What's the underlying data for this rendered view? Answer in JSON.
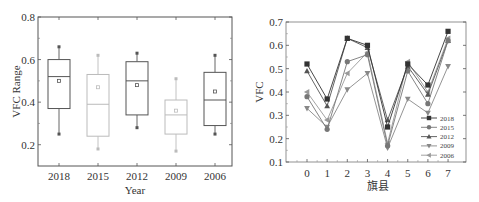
{
  "chart_data": [
    {
      "type": "box",
      "title": "",
      "xlabel": "Year",
      "ylabel": "VFC Range",
      "ylim": [
        0.1,
        0.8
      ],
      "yticks": [
        "0.2",
        "0.4",
        "0.6",
        "0.8"
      ],
      "categories": [
        "2018",
        "2015",
        "2012",
        "2009",
        "2006"
      ],
      "boxes": [
        {
          "name": "2018",
          "whisker_low": 0.25,
          "q1": 0.37,
          "median": 0.52,
          "q3": 0.6,
          "whisker_high": 0.66,
          "mean": 0.5,
          "color": "#555555"
        },
        {
          "name": "2015",
          "whisker_low": 0.18,
          "q1": 0.24,
          "median": 0.39,
          "q3": 0.53,
          "whisker_high": 0.62,
          "mean": 0.47,
          "color": "#bbbbbb"
        },
        {
          "name": "2012",
          "whisker_low": 0.28,
          "q1": 0.34,
          "median": 0.5,
          "q3": 0.59,
          "whisker_high": 0.63,
          "mean": 0.48,
          "color": "#555555"
        },
        {
          "name": "2009",
          "whisker_low": 0.17,
          "q1": 0.25,
          "median": 0.34,
          "q3": 0.41,
          "whisker_high": 0.51,
          "mean": 0.36,
          "color": "#bbbbbb"
        },
        {
          "name": "2006",
          "whisker_low": 0.25,
          "q1": 0.29,
          "median": 0.41,
          "q3": 0.54,
          "whisker_high": 0.62,
          "mean": 0.45,
          "color": "#555555"
        }
      ],
      "grid": false
    },
    {
      "type": "line",
      "title": "",
      "xlabel": "旗县",
      "ylabel": "VFC",
      "ylim": [
        0.1,
        0.7
      ],
      "yticks": [
        "0.1",
        "0.2",
        "0.3",
        "0.4",
        "0.5",
        "0.6",
        "0.7"
      ],
      "x": [
        0,
        1,
        2,
        3,
        4,
        5,
        6,
        7
      ],
      "xticks": [
        "0",
        "1",
        "2",
        "3",
        "4",
        "5",
        "6",
        "7"
      ],
      "legend_position": "lower right",
      "grid": false,
      "series": [
        {
          "name": "2018",
          "marker": "square",
          "color": "#333333",
          "values": [
            0.52,
            0.37,
            0.63,
            0.6,
            0.25,
            0.52,
            0.43,
            0.66
          ]
        },
        {
          "name": "2015",
          "marker": "circle",
          "color": "#777777",
          "values": [
            0.38,
            0.24,
            0.53,
            0.56,
            0.17,
            0.49,
            0.35,
            0.62
          ]
        },
        {
          "name": "2012",
          "marker": "triangle-up",
          "color": "#555555",
          "values": [
            0.49,
            0.34,
            0.63,
            0.59,
            0.28,
            0.51,
            0.39,
            0.62
          ]
        },
        {
          "name": "2009",
          "marker": "triangle-down",
          "color": "#888888",
          "values": [
            0.33,
            0.25,
            0.41,
            0.48,
            0.16,
            0.37,
            0.31,
            0.51
          ]
        },
        {
          "name": "2006",
          "marker": "triangle-left",
          "color": "#999999",
          "values": [
            0.4,
            0.28,
            0.48,
            0.57,
            0.18,
            0.53,
            0.4,
            0.63
          ]
        }
      ]
    }
  ]
}
